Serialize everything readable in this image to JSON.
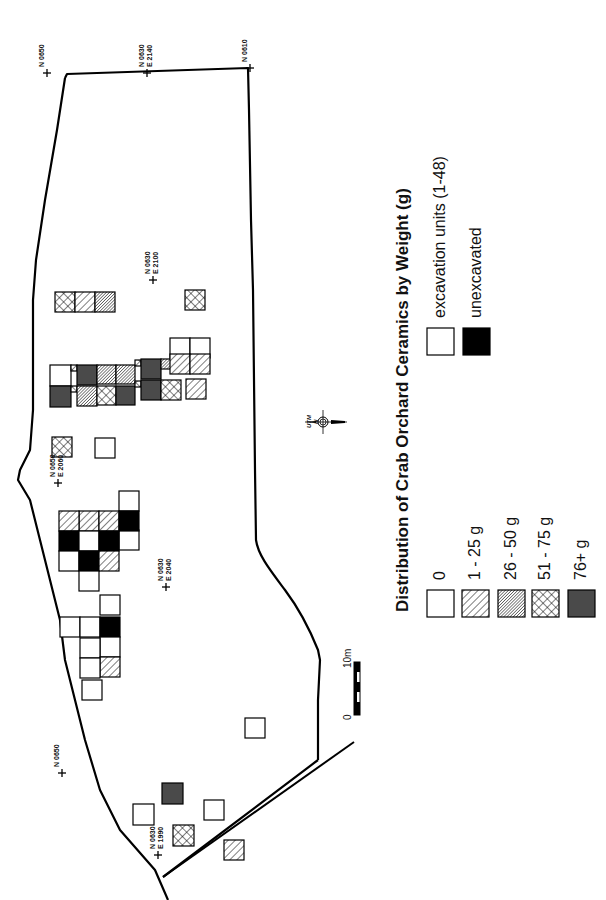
{
  "title": "Distribution of Crab Orchard Ceramics by Weight (g)",
  "colors": {
    "line": "#000000",
    "dark_fill": "#4a4a4a",
    "solid_fill": "#000000",
    "background": "#ffffff"
  },
  "legend": {
    "weight_classes": [
      {
        "key": "zero",
        "label": "0",
        "pattern": "empty"
      },
      {
        "key": "w1",
        "label": "1 - 25 g",
        "pattern": "diag-wide"
      },
      {
        "key": "w26",
        "label": "26 - 50 g",
        "pattern": "diag-fine"
      },
      {
        "key": "w51",
        "label": "51 - 75 g",
        "pattern": "crosshatch"
      },
      {
        "key": "w76",
        "label": "76+ g",
        "pattern": "dark"
      }
    ],
    "unit_types": [
      {
        "key": "unit",
        "label": "excavation units (1-48)",
        "pattern": "empty"
      },
      {
        "key": "unexc",
        "label": "unexcavated",
        "pattern": "solid"
      }
    ]
  },
  "grid_labels": [
    {
      "text_lines": [
        "N 0650"
      ],
      "x": 47,
      "y": 73
    },
    {
      "text_lines": [
        "N 0630",
        "E 2140"
      ],
      "x": 147,
      "y": 73
    },
    {
      "text_lines": [
        "N 0610"
      ],
      "x": 250,
      "y": 68
    },
    {
      "text_lines": [
        "N 0630",
        "E 2100"
      ],
      "x": 153,
      "y": 280
    },
    {
      "text_lines": [
        "N 0650",
        "E 2060"
      ],
      "x": 58,
      "y": 483
    },
    {
      "text_lines": [
        "N 0630",
        "E 2040"
      ],
      "x": 166,
      "y": 587
    },
    {
      "text_lines": [
        "N 0650"
      ],
      "x": 62,
      "y": 773
    },
    {
      "text_lines": [
        "N 0630",
        "E 1990"
      ],
      "x": 158,
      "y": 855
    }
  ],
  "compass": {
    "label_line1": "UTM",
    "label_line2": "N",
    "x": 323,
    "y": 422
  },
  "scale_bar": {
    "start_label": "0",
    "end_label": "10m",
    "length_m": 10
  },
  "units": [
    {
      "x": 55,
      "y": 292,
      "s": 20,
      "c": "w51"
    },
    {
      "x": 75,
      "y": 292,
      "s": 20,
      "c": "w1"
    },
    {
      "x": 95,
      "y": 292,
      "s": 20,
      "c": "w26"
    },
    {
      "x": 185,
      "y": 290,
      "s": 20,
      "c": "w51"
    },
    {
      "x": 50,
      "y": 365,
      "s": 21,
      "c": "zero"
    },
    {
      "x": 50,
      "y": 386,
      "s": 21,
      "c": "w76"
    },
    {
      "x": 71,
      "y": 365,
      "s": 6,
      "c": "w51"
    },
    {
      "x": 71,
      "y": 386,
      "s": 6,
      "c": "w51"
    },
    {
      "x": 77,
      "y": 365,
      "s": 20,
      "c": "w76"
    },
    {
      "x": 77,
      "y": 386,
      "s": 20,
      "c": "w26"
    },
    {
      "x": 97,
      "y": 365,
      "s": 19,
      "c": "w26"
    },
    {
      "x": 97,
      "y": 386,
      "s": 19,
      "c": "w51"
    },
    {
      "x": 116,
      "y": 365,
      "s": 19,
      "c": "w26"
    },
    {
      "x": 116,
      "y": 386,
      "s": 19,
      "c": "w76"
    },
    {
      "x": 135,
      "y": 360,
      "s": 6,
      "c": "w51"
    },
    {
      "x": 135,
      "y": 381,
      "s": 6,
      "c": "w51"
    },
    {
      "x": 141,
      "y": 359,
      "s": 20,
      "c": "w76"
    },
    {
      "x": 141,
      "y": 380,
      "s": 20,
      "c": "w76"
    },
    {
      "x": 161,
      "y": 359,
      "s": 10,
      "c": "w26"
    },
    {
      "x": 161,
      "y": 380,
      "s": 20,
      "c": "w51"
    },
    {
      "x": 170,
      "y": 338,
      "s": 20,
      "c": "zero"
    },
    {
      "x": 190,
      "y": 338,
      "s": 20,
      "c": "zero"
    },
    {
      "x": 170,
      "y": 354,
      "s": 20,
      "c": "w1"
    },
    {
      "x": 190,
      "y": 354,
      "s": 20,
      "c": "w1"
    },
    {
      "x": 186,
      "y": 379,
      "s": 20,
      "c": "w1"
    },
    {
      "x": 52,
      "y": 437,
      "s": 20,
      "c": "w51"
    },
    {
      "x": 95,
      "y": 438,
      "s": 20,
      "c": "zero"
    },
    {
      "x": 119,
      "y": 491,
      "s": 20,
      "c": "zero"
    },
    {
      "x": 119,
      "y": 530,
      "s": 20,
      "c": "zero"
    },
    {
      "x": 79,
      "y": 511,
      "s": 20,
      "c": "w1"
    },
    {
      "x": 99,
      "y": 511,
      "s": 20,
      "c": "w1"
    },
    {
      "x": 119,
      "y": 511,
      "s": 20,
      "c": "unexc"
    },
    {
      "x": 59,
      "y": 511,
      "s": 20,
      "c": "w1"
    },
    {
      "x": 59,
      "y": 531,
      "s": 20,
      "c": "unexc"
    },
    {
      "x": 79,
      "y": 531,
      "s": 20,
      "c": "zero"
    },
    {
      "x": 99,
      "y": 531,
      "s": 20,
      "c": "unexc"
    },
    {
      "x": 59,
      "y": 551,
      "s": 20,
      "c": "zero"
    },
    {
      "x": 79,
      "y": 551,
      "s": 20,
      "c": "unexc"
    },
    {
      "x": 99,
      "y": 551,
      "s": 20,
      "c": "w1"
    },
    {
      "x": 79,
      "y": 571,
      "s": 20,
      "c": "zero"
    },
    {
      "x": 100,
      "y": 595,
      "s": 20,
      "c": "zero"
    },
    {
      "x": 60,
      "y": 617,
      "s": 20,
      "c": "zero"
    },
    {
      "x": 80,
      "y": 617,
      "s": 20,
      "c": "zero"
    },
    {
      "x": 100,
      "y": 617,
      "s": 20,
      "c": "unexc"
    },
    {
      "x": 100,
      "y": 637,
      "s": 20,
      "c": "zero"
    },
    {
      "x": 80,
      "y": 638,
      "s": 20,
      "c": "zero"
    },
    {
      "x": 100,
      "y": 657,
      "s": 20,
      "c": "w1"
    },
    {
      "x": 80,
      "y": 658,
      "s": 20,
      "c": "zero"
    },
    {
      "x": 82,
      "y": 680,
      "s": 20,
      "c": "zero"
    },
    {
      "x": 245,
      "y": 718,
      "s": 20,
      "c": "zero"
    },
    {
      "x": 162,
      "y": 783,
      "s": 21,
      "c": "w76"
    },
    {
      "x": 133,
      "y": 804,
      "s": 21,
      "c": "zero"
    },
    {
      "x": 204,
      "y": 800,
      "s": 20,
      "c": "zero"
    },
    {
      "x": 173,
      "y": 825,
      "s": 21,
      "c": "w51"
    },
    {
      "x": 224,
      "y": 840,
      "s": 20,
      "c": "w1"
    }
  ],
  "legend_layout": {
    "weight_x": [
      427,
      462,
      498,
      532,
      568
    ],
    "weight_y": 590,
    "unit_x": [
      427,
      463
    ],
    "unit_y": 328,
    "box": 27
  }
}
